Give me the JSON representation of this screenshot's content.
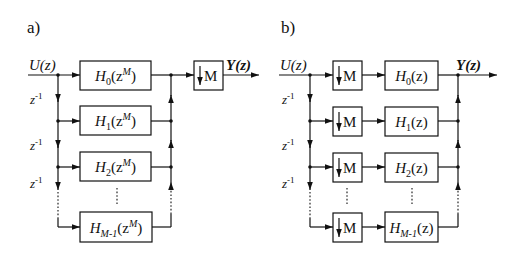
{
  "panels": [
    {
      "id": "a",
      "label": "a)",
      "input": "U(z)",
      "output": "Y(z)",
      "delay": "z",
      "delay_exp": "-1",
      "filters": [
        {
          "name": "H",
          "sub": "0",
          "arg_pre": "(z",
          "arg_sup": "M",
          "arg_post": ")"
        },
        {
          "name": "H",
          "sub": "1",
          "arg_pre": "(z",
          "arg_sup": "M",
          "arg_post": ")"
        },
        {
          "name": "H",
          "sub": "2",
          "arg_pre": "(z",
          "arg_sup": "M",
          "arg_post": ")"
        },
        {
          "name": "H",
          "sub": "M-1",
          "arg_pre": "(z",
          "arg_sup": "M",
          "arg_post": ")"
        }
      ],
      "downsampler": "M"
    },
    {
      "id": "b",
      "label": "b)",
      "input": "U(z)",
      "output": "Y(z)",
      "delay": "z",
      "delay_exp": "-1",
      "filters": [
        {
          "name": "H",
          "sub": "0",
          "arg": "(z)"
        },
        {
          "name": "H",
          "sub": "1",
          "arg": "(z)"
        },
        {
          "name": "H",
          "sub": "2",
          "arg": "(z)"
        },
        {
          "name": "H",
          "sub": "M-1",
          "arg": "(z)"
        }
      ],
      "downsampler": "M"
    }
  ]
}
